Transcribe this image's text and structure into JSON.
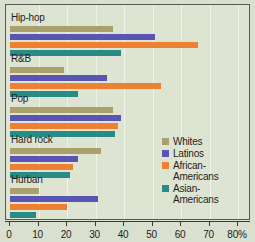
{
  "chart_data": {
    "type": "bar",
    "orientation": "horizontal",
    "title": "",
    "xlabel": "",
    "ylabel": "",
    "xlim": [
      0,
      80
    ],
    "xticks": [
      0,
      10,
      20,
      30,
      40,
      50,
      60,
      70,
      80
    ],
    "xticklabels": [
      "0",
      "10",
      "20",
      "30",
      "40",
      "50",
      "60",
      "70",
      "80%"
    ],
    "grid": true,
    "legend_position": "right",
    "categories": [
      "Hip-hop",
      "R&B",
      "Pop",
      "Hard rock",
      "Hurban"
    ],
    "series": [
      {
        "name": "Whites",
        "color": "#a9a06c",
        "values": [
          36,
          19,
          36,
          32,
          10
        ]
      },
      {
        "name": "Latinos",
        "color": "#5a55b4",
        "values": [
          51,
          34,
          39,
          24,
          31
        ]
      },
      {
        "name": "African-Americans",
        "color": "#ee8031",
        "values": [
          66,
          53,
          38,
          22,
          20
        ]
      },
      {
        "name": "Asian-Americans",
        "color": "#2a8a85",
        "values": [
          39,
          24,
          37,
          21,
          9
        ]
      }
    ]
  },
  "legend": {
    "entries": [
      {
        "label": "Whites",
        "color": "#a9a06c"
      },
      {
        "label": "Latinos",
        "color": "#5a55b4"
      },
      {
        "label": "African-\nAmericans",
        "color": "#ee8031"
      },
      {
        "label": "Asian-\nAmericans",
        "color": "#2a8a85"
      }
    ]
  },
  "colors": {
    "background": "#d9e0cf",
    "plot_background": "#dde4d2",
    "gridline": "#eef2e7",
    "axis": "#3a3a30",
    "text": "#1d1d1d"
  }
}
